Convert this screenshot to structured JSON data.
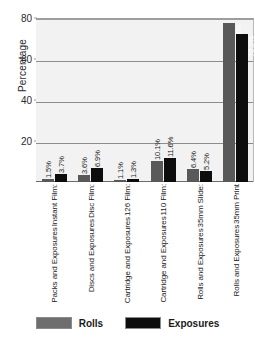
{
  "chart_data": {
    "type": "bar",
    "title": "",
    "xlabel": "",
    "ylabel": "Percentage",
    "ylim": [
      0,
      80
    ],
    "yticks": [
      20,
      40,
      60,
      80
    ],
    "grid": true,
    "legend_position": "bottom",
    "categories": [
      {
        "line1": "Instant Film:",
        "line2": "Packs and Exposures"
      },
      {
        "line1": "Disc Film:",
        "line2": "Discs and Exposures"
      },
      {
        "line1": "126 Film:",
        "line2": "Cartridge and Exposures"
      },
      {
        "line1": "110 Film:",
        "line2": "Cartridge and Exposures"
      },
      {
        "line1": "35mm Slide:",
        "line2": "Rolls and Exposures"
      },
      {
        "line1": "35mm Print",
        "line2": "Rolls and Exposures"
      }
    ],
    "series": [
      {
        "name": "Rolls",
        "color": "#595959",
        "values": [
          1.5,
          3.6,
          1.1,
          10.1,
          6.4,
          77.4
        ],
        "labels": [
          "1.5%",
          "3.6%",
          "1.1%",
          "10.1%",
          "6.4%",
          "77.4%"
        ]
      },
      {
        "name": "Exposures",
        "color": "#0d0d0d",
        "values": [
          3.7,
          6.9,
          1.3,
          11.6,
          5.2,
          72.2
        ],
        "labels": [
          "3.7%",
          "6.9%",
          "1.3%",
          "11.6%",
          "5.2%",
          "72.2%"
        ]
      }
    ]
  },
  "legend": {
    "items": [
      {
        "label": "Rolls",
        "color": "#6e6e6e"
      },
      {
        "label": "Exposures",
        "color": "#0d0d0d"
      }
    ]
  }
}
